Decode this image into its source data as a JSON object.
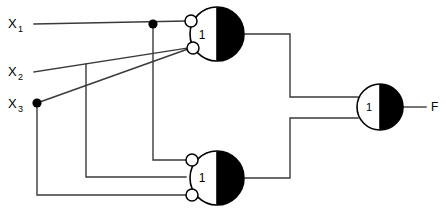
{
  "diagram": {
    "type": "logic-circuit-schematic",
    "background_color": "#ffffff",
    "line_color": "#3a3a3a",
    "fill_black": "#000000",
    "fill_white": "#ffffff"
  },
  "inputs": [
    {
      "id": "x1",
      "label": "X",
      "subscript": "1",
      "x": 10,
      "y": 22
    },
    {
      "id": "x2",
      "label": "X",
      "subscript": "2",
      "x": 10,
      "y": 70
    },
    {
      "id": "x3",
      "label": "X",
      "subscript": "3",
      "x": 10,
      "y": 104
    }
  ],
  "outputs": [
    {
      "id": "f",
      "label": "F",
      "x": 432,
      "y": 107
    }
  ],
  "gates": [
    {
      "id": "gate-top",
      "symbol": "1",
      "cx": 217,
      "cy": 34,
      "r": 27,
      "inputs": [
        {
          "y": 21,
          "bubble": true
        },
        {
          "y": 48,
          "bubble": true
        }
      ],
      "output_inverted": true
    },
    {
      "id": "gate-bottom",
      "symbol": "1",
      "cx": 217,
      "cy": 178,
      "r": 27,
      "inputs": [
        {
          "y": 160,
          "bubble": true
        },
        {
          "y": 177,
          "bubble": false
        },
        {
          "y": 195,
          "bubble": true
        }
      ],
      "output_inverted": true
    },
    {
      "id": "gate-output",
      "symbol": "1",
      "cx": 380,
      "cy": 107,
      "r": 23,
      "inputs": [
        {
          "y": 97,
          "bubble": false
        },
        {
          "y": 118,
          "bubble": false
        }
      ],
      "output_inverted": true
    }
  ],
  "junction_dots": [
    {
      "id": "dot-x1",
      "x": 153,
      "y": 24
    },
    {
      "id": "dot-x3",
      "x": 37,
      "y": 103
    }
  ],
  "wires": [
    {
      "id": "wire-x1-main",
      "from": "X1",
      "to": "gate-top input 1"
    },
    {
      "id": "wire-x1-branch",
      "from": "dot-x1",
      "to": "gate-bottom input 1"
    },
    {
      "id": "wire-x2-main",
      "from": "X2",
      "to": "gate-top input 2"
    },
    {
      "id": "wire-x2-branch",
      "from": "x2 line at x=86",
      "to": "gate-bottom input 2"
    },
    {
      "id": "wire-x3-main",
      "from": "X3",
      "to": "gate-top input 2"
    },
    {
      "id": "wire-x3-branch",
      "from": "dot-x3",
      "to": "gate-bottom input 3"
    },
    {
      "id": "wire-top-out",
      "from": "gate-top output",
      "to": "gate-output input 1"
    },
    {
      "id": "wire-bottom-out",
      "from": "gate-bottom output",
      "to": "gate-output input 2"
    },
    {
      "id": "wire-f",
      "from": "gate-output",
      "to": "F"
    }
  ]
}
